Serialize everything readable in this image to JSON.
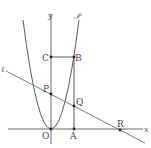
{
  "diagram": {
    "type": "coordinate-geometry",
    "axes": {
      "x_label": "x",
      "y_label": "y",
      "origin_label": "O"
    },
    "curves": [
      {
        "id": "parabola",
        "label": "𝒫",
        "kind": "parabola",
        "vertex": "O"
      },
      {
        "id": "line",
        "label": "ℓ",
        "kind": "line"
      }
    ],
    "points": [
      {
        "label": "O"
      },
      {
        "label": "A"
      },
      {
        "label": "B"
      },
      {
        "label": "C"
      },
      {
        "label": "P"
      },
      {
        "label": "Q"
      },
      {
        "label": "R"
      }
    ],
    "segments": [
      "CB",
      "BA"
    ]
  },
  "labels": {
    "x": "x",
    "y": "y",
    "O": "O",
    "A": "A",
    "B": "B",
    "C": "C",
    "P": "P",
    "Q": "Q",
    "R": "R",
    "parabola": "𝒫",
    "line": "ℓ"
  }
}
